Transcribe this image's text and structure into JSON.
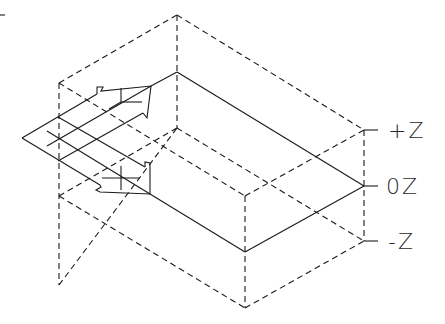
{
  "diagram": {
    "type": "isometric-box-with-arrows",
    "colors": {
      "line": "#1a1a1a",
      "background": "#ffffff"
    },
    "labels": {
      "plus_z": "+Z",
      "zero_z": "0Z",
      "minus_z": "-Z"
    },
    "elements": [
      "dashed isometric bounding box",
      "solid mid-plane (0Z) rhombus",
      "upper arrow with cross marker",
      "lower arrow with cross marker",
      "diamond grid at left",
      "Z-axis ticks on right edge"
    ]
  }
}
